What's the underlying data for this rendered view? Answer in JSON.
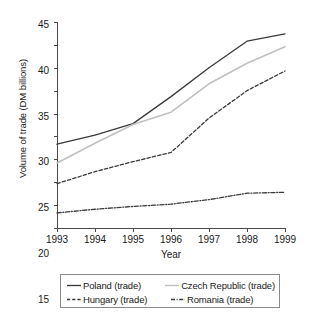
{
  "chart_data": {
    "type": "line",
    "title": "",
    "xlabel": "Year",
    "ylabel": "Volume of trade (DM billions)",
    "categories": [
      "1993",
      "1994",
      "1995",
      "1996",
      "1997",
      "1998",
      "1999"
    ],
    "x": [
      1993,
      1994,
      1995,
      1996,
      1997,
      1998,
      1999
    ],
    "xlim": [
      1993,
      1999
    ],
    "ylim": [
      0,
      45
    ],
    "y_ticks": [
      0,
      5,
      10,
      15,
      20,
      25,
      30,
      35,
      40,
      45
    ],
    "grid": false,
    "legend_position": "bottom",
    "series": [
      {
        "name": "Poland (trade)",
        "style": "solid",
        "color": "#3a3a3a",
        "values": [
          18.3,
          20.3,
          22.8,
          28.7,
          35.0,
          40.8,
          42.4
        ]
      },
      {
        "name": "Czech Republic (trade)",
        "style": "solid-light",
        "color": "#c0c0c0",
        "values": [
          14.2,
          18.5,
          22.6,
          25.3,
          31.5,
          36.0,
          39.6
        ]
      },
      {
        "name": "Hungary (trade)",
        "style": "dashed",
        "color": "#3a3a3a",
        "values": [
          9.7,
          12.3,
          14.5,
          16.5,
          24.0,
          30.0,
          34.3
        ]
      },
      {
        "name": "Romania (trade)",
        "style": "dash-dot",
        "color": "#3a3a3a",
        "values": [
          3.3,
          4.1,
          4.7,
          5.2,
          6.2,
          7.6,
          7.8
        ]
      }
    ]
  },
  "axes": {
    "y_title": "Volume of trade (DM billions)",
    "x_title": "Year",
    "y_tick_labels": [
      "0",
      "5",
      "10",
      "15",
      "20",
      "25",
      "30",
      "35",
      "40",
      "45"
    ],
    "x_tick_labels": [
      "1993",
      "1994",
      "1995",
      "1996",
      "1997",
      "1998",
      "1999"
    ]
  },
  "legend": {
    "items": [
      {
        "label": "Poland (trade)",
        "style": "solid",
        "color": "#3a3a3a"
      },
      {
        "label": "Czech Republic (trade)",
        "style": "solid-light",
        "color": "#c0c0c0"
      },
      {
        "label": "Hungary (trade)",
        "style": "dashed",
        "color": "#3a3a3a"
      },
      {
        "label": "Romania (trade)",
        "style": "dash-dot",
        "color": "#3a3a3a"
      }
    ]
  }
}
